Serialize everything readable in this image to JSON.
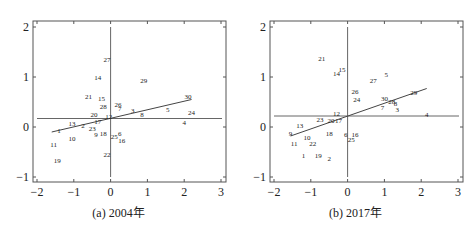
{
  "chart_data": [
    {
      "type": "scatter",
      "title": "(a) 2004年",
      "xlabel": "",
      "ylabel": "",
      "xlim": [
        -2.1,
        3.05
      ],
      "ylim": [
        -1.1,
        2.1
      ],
      "xticks": [
        -2,
        -1,
        0,
        1,
        2,
        3
      ],
      "yticks": [
        -1,
        0,
        1,
        2
      ],
      "grid": false,
      "legend": "none",
      "reference_lines": {
        "horizontal_y": 0.17,
        "vertical_x": 0.0
      },
      "fit_line": {
        "x0": -1.6,
        "y0": -0.1,
        "x1": 2.2,
        "y1": 0.55
      },
      "points": [
        {
          "label": "1",
          "x": -1.4,
          "y": -0.07
        },
        {
          "label": "2",
          "x": -0.75,
          "y": 0.04
        },
        {
          "label": "3",
          "x": 0.6,
          "y": 0.33
        },
        {
          "label": "4",
          "x": 2.0,
          "y": 0.09
        },
        {
          "label": "5",
          "x": 1.55,
          "y": 0.36
        },
        {
          "label": "6",
          "x": 0.25,
          "y": -0.13
        },
        {
          "label": "7",
          "x": 0.25,
          "y": 0.38
        },
        {
          "label": "8",
          "x": 0.85,
          "y": 0.25
        },
        {
          "label": "9",
          "x": -0.4,
          "y": -0.15
        },
        {
          "label": "10",
          "x": -1.05,
          "y": -0.23
        },
        {
          "label": "11",
          "x": -1.55,
          "y": -0.35
        },
        {
          "label": "12",
          "x": -0.05,
          "y": 0.22
        },
        {
          "label": "13",
          "x": -1.05,
          "y": 0.07
        },
        {
          "label": "14",
          "x": -0.35,
          "y": 1.0
        },
        {
          "label": "15",
          "x": -0.25,
          "y": 0.58
        },
        {
          "label": "16",
          "x": 0.3,
          "y": -0.27
        },
        {
          "label": "17",
          "x": -0.35,
          "y": 0.11
        },
        {
          "label": "18",
          "x": -0.2,
          "y": -0.12
        },
        {
          "label": "19",
          "x": -1.45,
          "y": -0.67
        },
        {
          "label": "20",
          "x": -0.45,
          "y": 0.26
        },
        {
          "label": "21",
          "x": -0.6,
          "y": 0.62
        },
        {
          "label": "22",
          "x": -0.1,
          "y": -0.55
        },
        {
          "label": "23",
          "x": -0.5,
          "y": -0.02
        },
        {
          "label": "24",
          "x": 2.2,
          "y": 0.3
        },
        {
          "label": "25",
          "x": 0.1,
          "y": -0.19
        },
        {
          "label": "26",
          "x": 0.2,
          "y": 0.45
        },
        {
          "label": "27",
          "x": -0.1,
          "y": 1.36
        },
        {
          "label": "28",
          "x": -0.2,
          "y": 0.41
        },
        {
          "label": "29",
          "x": 0.9,
          "y": 0.93
        },
        {
          "label": "30",
          "x": 2.1,
          "y": 0.62
        }
      ]
    },
    {
      "type": "scatter",
      "title": "(b) 2017年",
      "xlabel": "",
      "ylabel": "",
      "xlim": [
        -2.1,
        3.05
      ],
      "ylim": [
        -1.1,
        2.1
      ],
      "xticks": [
        -2,
        -1,
        0,
        1,
        2,
        3
      ],
      "yticks": [
        -1,
        0,
        1,
        2
      ],
      "grid": false,
      "legend": "none",
      "reference_lines": {
        "horizontal_y": 0.22,
        "vertical_x": 0.0
      },
      "fit_line": {
        "x0": -1.55,
        "y0": -0.18,
        "x1": 2.15,
        "y1": 0.77
      },
      "points": [
        {
          "label": "1",
          "x": -1.2,
          "y": -0.57
        },
        {
          "label": "2",
          "x": -0.5,
          "y": -0.62
        },
        {
          "label": "3",
          "x": 1.35,
          "y": 0.35
        },
        {
          "label": "4",
          "x": 2.15,
          "y": 0.26
        },
        {
          "label": "5",
          "x": 1.05,
          "y": 1.05
        },
        {
          "label": "6",
          "x": -0.05,
          "y": -0.15
        },
        {
          "label": "7",
          "x": 0.95,
          "y": 0.4
        },
        {
          "label": "8",
          "x": 1.3,
          "y": 0.47
        },
        {
          "label": "9",
          "x": -1.55,
          "y": -0.12
        },
        {
          "label": "10",
          "x": -1.1,
          "y": -0.2
        },
        {
          "label": "11",
          "x": -1.45,
          "y": -0.33
        },
        {
          "label": "12",
          "x": -0.3,
          "y": 0.28
        },
        {
          "label": "13",
          "x": -1.3,
          "y": 0.04
        },
        {
          "label": "14",
          "x": -0.3,
          "y": 1.08
        },
        {
          "label": "15",
          "x": -0.15,
          "y": 1.15
        },
        {
          "label": "16",
          "x": 0.2,
          "y": -0.14
        },
        {
          "label": "17",
          "x": -0.25,
          "y": 0.14
        },
        {
          "label": "18",
          "x": -0.5,
          "y": -0.12
        },
        {
          "label": "19",
          "x": -0.8,
          "y": -0.57
        },
        {
          "label": "20",
          "x": -0.45,
          "y": 0.14
        },
        {
          "label": "21",
          "x": -0.7,
          "y": 1.37
        },
        {
          "label": "22",
          "x": -0.95,
          "y": -0.32
        },
        {
          "label": "23",
          "x": -0.75,
          "y": 0.15
        },
        {
          "label": "24",
          "x": 0.25,
          "y": 0.55
        },
        {
          "label": "25",
          "x": 0.1,
          "y": -0.25
        },
        {
          "label": "26",
          "x": 0.2,
          "y": 0.72
        },
        {
          "label": "27",
          "x": 0.7,
          "y": 0.93
        },
        {
          "label": "28",
          "x": 1.2,
          "y": 0.52
        },
        {
          "label": "29",
          "x": 1.8,
          "y": 0.7
        },
        {
          "label": "30",
          "x": 1.0,
          "y": 0.58
        }
      ]
    }
  ],
  "captions": {
    "a": "(a) 2004年",
    "b": "(b) 2017年"
  }
}
